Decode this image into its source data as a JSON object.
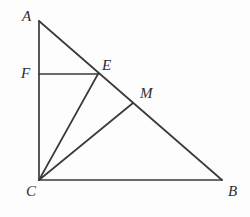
{
  "figure": {
    "type": "geometry-diagram",
    "canvas": {
      "width": 250,
      "height": 217
    },
    "style": {
      "background_color": "#fdfdfd",
      "stroke_color": "#3a3a3a",
      "stroke_width": 1.7,
      "label_color": "#2e2e2e",
      "label_font_size": 15
    },
    "points": [
      {
        "id": "A",
        "label": "A",
        "x": 39,
        "y": 21,
        "label_x": 22,
        "label_y": 9,
        "role": "triangle-vertex"
      },
      {
        "id": "F",
        "label": "F",
        "x": 39,
        "y": 74,
        "label_x": 21,
        "label_y": 66,
        "role": "point-on-leg-AC"
      },
      {
        "id": "E",
        "label": "E",
        "x": 98,
        "y": 74,
        "label_x": 102,
        "label_y": 58,
        "role": "point-on-hypotenuse"
      },
      {
        "id": "M",
        "label": "M",
        "x": 133,
        "y": 103,
        "label_x": 140,
        "label_y": 86,
        "role": "point-on-hypotenuse"
      },
      {
        "id": "C",
        "label": "C",
        "x": 39,
        "y": 180,
        "label_x": 26,
        "label_y": 184,
        "role": "right-angle-vertex"
      },
      {
        "id": "B",
        "label": "B",
        "x": 222,
        "y": 180,
        "label_x": 228,
        "label_y": 184,
        "role": "triangle-vertex"
      }
    ],
    "segments": [
      {
        "id": "AC",
        "name": "segment-ac",
        "from": "A",
        "to": "C",
        "x1": 39,
        "y1": 21,
        "x2": 39,
        "y2": 180
      },
      {
        "id": "CB",
        "name": "segment-cb",
        "from": "C",
        "to": "B",
        "x1": 39,
        "y1": 180,
        "x2": 222,
        "y2": 180
      },
      {
        "id": "AB",
        "name": "segment-ab",
        "from": "A",
        "to": "B",
        "x1": 39,
        "y1": 21,
        "x2": 222,
        "y2": 180
      },
      {
        "id": "FE",
        "name": "segment-fe",
        "from": "F",
        "to": "E",
        "x1": 39,
        "y1": 74,
        "x2": 99,
        "y2": 74
      },
      {
        "id": "CE",
        "name": "segment-ce",
        "from": "C",
        "to": "E",
        "x1": 39,
        "y1": 180,
        "x2": 98,
        "y2": 74
      },
      {
        "id": "CM",
        "name": "segment-cm",
        "from": "C",
        "to": "M",
        "x1": 39,
        "y1": 180,
        "x2": 133,
        "y2": 103
      }
    ]
  }
}
